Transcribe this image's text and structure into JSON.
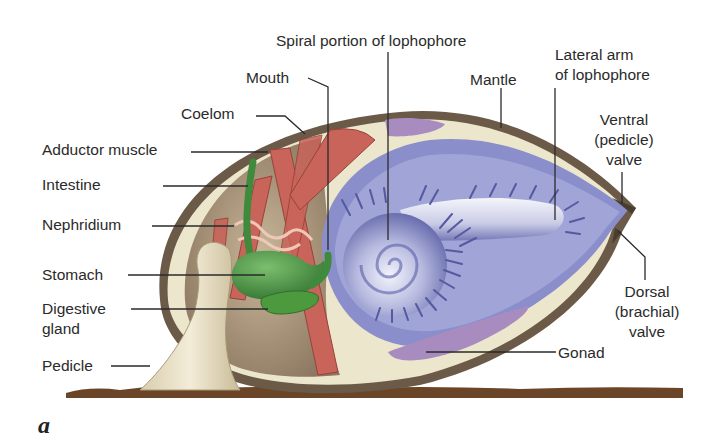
{
  "figure": {
    "panel_letter": "a",
    "colors": {
      "shell": "#6b5a48",
      "mantle_cream": "#ece6cc",
      "muscle": "#c8645a",
      "gut_green": "#3f8a3c",
      "lophophore_blue": "#6f74b8",
      "lophophore_light": "#e8ebf7",
      "gonad_purple": "#a88cc0",
      "pedicle": "#e6dcc2",
      "substrate": "#6b4528",
      "label_text": "#2a2a2a",
      "leader_line": "#2a2a2a"
    }
  },
  "labels": {
    "spiral_lophophore": "Spiral portion of lophophore",
    "mouth": "Mouth",
    "coelom": "Coelom",
    "adductor_muscle": "Adductor muscle",
    "intestine": "Intestine",
    "nephridium": "Nephridium",
    "stomach": "Stomach",
    "digestive_gland_1": "Digestive",
    "digestive_gland_2": "gland",
    "pedicle": "Pedicle",
    "mantle": "Mantle",
    "lateral_arm_1": "Lateral arm",
    "lateral_arm_2": "of lophophore",
    "ventral_valve_1": "Ventral",
    "ventral_valve_2": "(pedicle)",
    "ventral_valve_3": "valve",
    "dorsal_valve_1": "Dorsal",
    "dorsal_valve_2": "(brachial)",
    "dorsal_valve_3": "valve",
    "gonad": "Gonad"
  }
}
